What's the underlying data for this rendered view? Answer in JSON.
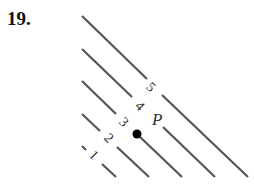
{
  "problem_number": "19.",
  "diagram": {
    "contour_levels": [
      "1",
      "2",
      "3",
      "4",
      "5"
    ],
    "point_label": "P",
    "line_color": "#555555",
    "point_color": "#000000"
  }
}
